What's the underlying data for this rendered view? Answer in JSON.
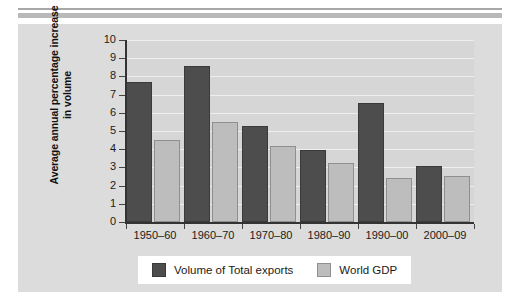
{
  "chart_data": {
    "type": "bar",
    "title": "",
    "xlabel": "",
    "ylabel": "Average annual percentage increase in volume",
    "ylim": [
      0,
      10
    ],
    "yticks": [
      0,
      1,
      2,
      3,
      4,
      5,
      6,
      7,
      8,
      9,
      10
    ],
    "ytick_labels": [
      "0",
      "1",
      "2",
      "3",
      "4",
      "5",
      "6",
      "7",
      "8",
      "9",
      "10"
    ],
    "grid": true,
    "legend_position": "bottom-center",
    "categories": [
      "1950–60",
      "1960–70",
      "1970–80",
      "1980–90",
      "1990–00",
      "2000–09"
    ],
    "series": [
      {
        "name": "Volume of Total exports",
        "color": "#4d4d4d",
        "values": [
          7.7,
          8.55,
          5.3,
          3.95,
          6.55,
          3.1
        ]
      },
      {
        "name": "World GDP",
        "color": "#bdbdbd",
        "values": [
          4.5,
          5.5,
          4.15,
          3.25,
          2.4,
          2.55
        ]
      }
    ]
  },
  "figure": {
    "panel_background": "#dcdcdc",
    "plot_background": "#d6d6d6",
    "gridline_color": "#efefef",
    "axis_color": "#333333",
    "page_background": "#ffffff",
    "rule_color_thin": "#a8a8a8",
    "rule_color_thick": "#b9b9b9"
  },
  "legend": {
    "items": [
      {
        "label": "Volume of Total exports",
        "color": "#4d4d4d"
      },
      {
        "label": "World GDP",
        "color": "#bdbdbd"
      }
    ]
  }
}
